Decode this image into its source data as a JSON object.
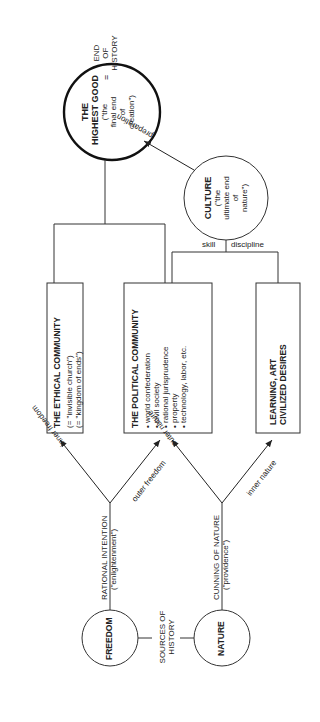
{
  "diagram": {
    "highest_good": {
      "title_1": "THE",
      "title_2": "HIGHEST GOOD",
      "sub_1": "(\"the",
      "sub_2": "final  end",
      "sub_3": "of",
      "sub_4": "creation\")"
    },
    "end_of_history": {
      "eq": "=",
      "l1": "END",
      "l2": "OF",
      "l3": "HISTORY"
    },
    "culture": {
      "title": "CULTURE",
      "sub_1": "(\"the",
      "sub_2": "ultimate end",
      "sub_3": "of",
      "sub_4": "nature\")"
    },
    "edge_preparation": "preparation",
    "edge_skill": "skill",
    "edge_discipline": "discipline",
    "ethical_community": {
      "title": "THE  ETHICAL  COMMUNITY",
      "line_1": "(= \"invisible church\")",
      "line_2": "(= \"kingdom  of  ends\")"
    },
    "political_community": {
      "title": "THE POLITICAL COMMUNITY",
      "items": [
        "world confederation",
        "civil society",
        "rational jurisprudence",
        "property",
        "technology, labor, etc."
      ]
    },
    "learning": {
      "line_1": "LEARNING,  ART",
      "line_2": "CIVILIZED  DESIRES"
    },
    "edge_inner_freedom": "inner freedom",
    "edge_outer_freedom": "outer freedom",
    "edge_outer_nature": "outer nature",
    "edge_inner_nature": "inner nature",
    "rational_intention": {
      "l1": "RATIONAL INTENTION",
      "l2": "(\"enlightenment\")"
    },
    "cunning_of_nature": {
      "l1": "CUNNING OF NATURE",
      "l2": "(\"providence\")"
    },
    "freedom": "FREEDOM",
    "nature": "NATURE",
    "sources": {
      "l1": "SOURCES OF",
      "l2": "HISTORY"
    }
  }
}
